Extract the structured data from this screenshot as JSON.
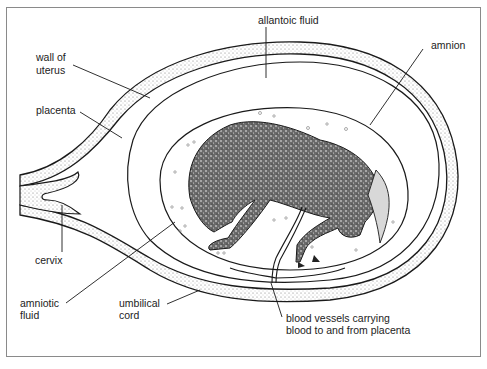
{
  "figure": {
    "labels": {
      "allantoic_fluid": "allantoic fluid",
      "wall_of_uterus_line1": "wall of",
      "wall_of_uterus_line2": "uterus",
      "amnion": "amnion",
      "placenta": "placenta",
      "cervix": "cervix",
      "amniotic_fluid_line1": "amniotic",
      "amniotic_fluid_line2": "fluid",
      "umbilical_cord_line1": "umbilical",
      "umbilical_cord_line2": "cord",
      "blood_vessels_line1": "blood vessels carrying",
      "blood_vessels_line2": "blood to and from placenta"
    },
    "colors": {
      "line": "#1a1a1a",
      "stipple": "#bdbdbd",
      "foal": "#3a3a3a",
      "frame": "#8a8a8a"
    }
  }
}
